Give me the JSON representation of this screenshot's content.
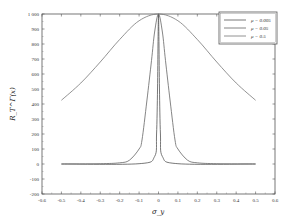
{
  "chart_data": {
    "type": "line",
    "title": "",
    "xlabel": "σ_y",
    "ylabel": "R_T^Γ(x)",
    "xlim": [
      -0.6,
      0.6
    ],
    "ylim": [
      -200,
      1000
    ],
    "x_ticks": [
      -0.6,
      -0.5,
      -0.4,
      -0.3,
      -0.2,
      -0.1,
      0,
      0.1,
      0.2,
      0.3,
      0.4,
      0.5,
      0.6
    ],
    "x_tick_labels": [
      "-0.6",
      "-0.5",
      "-0.4",
      "-0.3",
      "-0.2",
      "-0.1",
      "0",
      "0.1",
      "0.2",
      "0.3",
      "0.4",
      "0.5",
      "0.6"
    ],
    "y_ticks": [
      -200,
      -100,
      0,
      100,
      200,
      300,
      400,
      500,
      600,
      700,
      800,
      900,
      1000
    ],
    "y_tick_labels": [
      "-200",
      "-100",
      "0",
      "100",
      "200",
      "300",
      "400",
      "500",
      "600",
      "700",
      "800",
      "900",
      "1 000"
    ],
    "grid": false,
    "legend_position": "upper right",
    "series": [
      {
        "name": "μ = 0.005",
        "color": "#555555",
        "x": [
          -0.5,
          -0.1,
          -0.02,
          -0.01,
          -0.005,
          -0.0025,
          0,
          0.0025,
          0.005,
          0.01,
          0.02,
          0.1,
          0.5
        ],
        "values": [
          0,
          2,
          50,
          200,
          500,
          800,
          1000,
          800,
          500,
          200,
          50,
          2,
          0
        ]
      },
      {
        "name": "μ = 0.05",
        "color": "#666666",
        "x": [
          -0.5,
          -0.3,
          -0.2,
          -0.15,
          -0.1,
          -0.085,
          -0.06,
          -0.036,
          -0.02,
          0,
          0.02,
          0.036,
          0.06,
          0.085,
          0.1,
          0.15,
          0.2,
          0.3,
          0.5
        ],
        "values": [
          0,
          2,
          8,
          25,
          100,
          160,
          420,
          690,
          880,
          1000,
          880,
          690,
          420,
          160,
          100,
          25,
          8,
          2,
          0
        ]
      },
      {
        "name": "μ = 0.5",
        "color": "#777777",
        "x": [
          -0.5,
          -0.4,
          -0.3,
          -0.2,
          -0.1,
          0,
          0.1,
          0.2,
          0.3,
          0.4,
          0.5
        ],
        "values": [
          425,
          540,
          680,
          830,
          955,
          1000,
          955,
          830,
          680,
          540,
          425
        ]
      }
    ]
  }
}
